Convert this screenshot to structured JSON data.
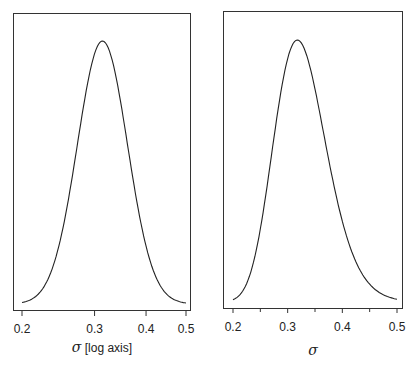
{
  "chart_data": [
    {
      "type": "line",
      "title": "",
      "xlabel": "σ [log axis]",
      "ylabel": "",
      "xscale": "log",
      "xlim": [
        0.2,
        0.5
      ],
      "xticks": [
        0.2,
        0.3,
        0.4,
        0.5
      ],
      "xtick_labels": [
        "0.2",
        "0.3",
        "0.4",
        "0.5"
      ],
      "grid": false,
      "legend": null,
      "description": "Posterior density of sigma on log axis, symmetric bell shape",
      "mode": 0.31,
      "distribution": {
        "family": "normal_in_log_sigma",
        "mean_log": -1.16,
        "sd_log": 0.14
      },
      "x": [
        0.2,
        0.22,
        0.24,
        0.26,
        0.28,
        0.3,
        0.31,
        0.32,
        0.34,
        0.36,
        0.38,
        0.4,
        0.43,
        0.46,
        0.5
      ],
      "values": [
        0.01,
        0.05,
        0.17,
        0.4,
        0.7,
        0.95,
        1.0,
        0.98,
        0.86,
        0.66,
        0.46,
        0.29,
        0.13,
        0.05,
        0.01
      ]
    },
    {
      "type": "line",
      "title": "",
      "xlabel": "σ",
      "ylabel": "",
      "xscale": "linear",
      "xlim": [
        0.2,
        0.5
      ],
      "xticks": [
        0.2,
        0.3,
        0.4,
        0.5
      ],
      "xtick_labels": [
        "0.2",
        "0.3",
        "0.4",
        "0.5"
      ],
      "minor_xticks": [
        0.25,
        0.35,
        0.45
      ],
      "grid": false,
      "legend": null,
      "description": "Posterior density of sigma on linear axis, right-skewed bell shape",
      "mode": 0.305,
      "x": [
        0.2,
        0.22,
        0.24,
        0.26,
        0.28,
        0.3,
        0.31,
        0.32,
        0.34,
        0.36,
        0.38,
        0.4,
        0.43,
        0.46,
        0.5
      ],
      "values": [
        0.02,
        0.09,
        0.29,
        0.58,
        0.87,
        1.0,
        0.99,
        0.94,
        0.75,
        0.53,
        0.34,
        0.2,
        0.08,
        0.03,
        0.005
      ]
    }
  ],
  "panels": {
    "left": {
      "xlabel_symbol": "σ",
      "xlabel_suffix": " [log axis]",
      "tick_labels": [
        "0.2",
        "0.3",
        "0.4",
        "0.5"
      ]
    },
    "right": {
      "xlabel_symbol": "σ",
      "tick_labels": [
        "0.2",
        "0.3",
        "0.4",
        "0.5"
      ]
    }
  }
}
